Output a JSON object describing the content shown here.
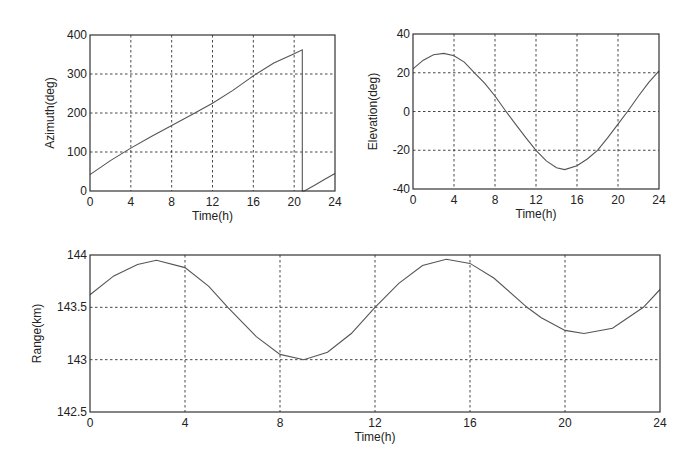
{
  "chart_data": [
    {
      "type": "line",
      "id": "azimuth",
      "title": "",
      "xlabel": "Time(h)",
      "ylabel": "Azimuth(deg)",
      "xlim": [
        0,
        24
      ],
      "ylim": [
        0,
        400
      ],
      "xticks": [
        0,
        4,
        8,
        12,
        16,
        20,
        24
      ],
      "yticks": [
        0,
        100,
        200,
        300,
        400
      ],
      "grid": true,
      "series": [
        {
          "name": "Azimuth",
          "x": [
            0,
            2,
            4,
            6,
            8,
            10,
            12,
            14,
            16,
            18,
            20,
            20.8,
            20.8,
            21.0,
            22,
            23,
            24
          ],
          "y": [
            42,
            78,
            110,
            140,
            168,
            196,
            225,
            258,
            295,
            328,
            352,
            362,
            0,
            0,
            15,
            30,
            45
          ]
        }
      ],
      "frame": {
        "left": 90,
        "top": 35,
        "right": 335,
        "bottom": 191
      }
    },
    {
      "type": "line",
      "id": "elevation",
      "title": "",
      "xlabel": "Time(h)",
      "ylabel": "Elevation(deg)",
      "xlim": [
        0,
        24
      ],
      "ylim": [
        -40,
        40
      ],
      "xticks": [
        0,
        4,
        8,
        12,
        16,
        20,
        24
      ],
      "yticks": [
        -40,
        -20,
        0,
        20,
        40
      ],
      "grid": true,
      "series": [
        {
          "name": "Elevation",
          "x": [
            0,
            1,
            2,
            3,
            4,
            5,
            6,
            7,
            8,
            9,
            10,
            11,
            12,
            13,
            14,
            14.8,
            16,
            17,
            18,
            19,
            20,
            21,
            22,
            23,
            24
          ],
          "y": [
            22,
            26.5,
            29.3,
            30,
            28.8,
            25.5,
            20,
            14.5,
            8,
            0.5,
            -6.5,
            -13.5,
            -20,
            -25.5,
            -29,
            -30,
            -28,
            -24.5,
            -20,
            -13.5,
            -6.5,
            0.5,
            8,
            15,
            21
          ]
        }
      ],
      "frame": {
        "left": 413,
        "top": 34,
        "right": 659,
        "bottom": 189
      }
    },
    {
      "type": "line",
      "id": "range",
      "title": "",
      "xlabel": "Time(h)",
      "ylabel": "Range(km)",
      "xlim": [
        0,
        24
      ],
      "ylim": [
        142.5,
        144
      ],
      "xticks": [
        0,
        4,
        8,
        12,
        16,
        20,
        24
      ],
      "yticks": [
        142.5,
        143,
        143.5,
        144
      ],
      "ytick_labels": [
        "142.5",
        "143",
        "143.5",
        "144"
      ],
      "grid": true,
      "series": [
        {
          "name": "Range",
          "x": [
            0,
            1,
            2,
            2.8,
            4,
            5,
            5.8,
            7,
            8,
            9,
            10,
            11,
            12,
            13,
            14,
            15,
            16,
            17,
            18.4,
            19,
            20,
            20.8,
            22,
            23.3,
            24
          ],
          "y": [
            143.62,
            143.8,
            143.91,
            143.95,
            143.88,
            143.7,
            143.5,
            143.22,
            143.05,
            143.0,
            143.07,
            143.25,
            143.5,
            143.73,
            143.9,
            143.96,
            143.92,
            143.78,
            143.5,
            143.4,
            143.28,
            143.25,
            143.3,
            143.5,
            143.67
          ]
        }
      ],
      "frame": {
        "left": 90,
        "top": 255,
        "right": 660,
        "bottom": 412
      }
    }
  ]
}
